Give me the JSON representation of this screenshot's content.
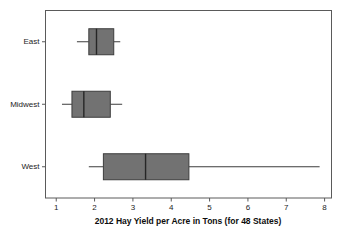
{
  "chart_data": {
    "type": "box",
    "title": "",
    "xlabel": "2012 Hay Yield per Acre in Tons (for 48 States)",
    "ylabel": "",
    "orientation": "horizontal",
    "grid": false,
    "legend": "none",
    "xlim": [
      0.72,
      8.18
    ],
    "xticks": [
      1,
      2,
      3,
      4,
      5,
      6,
      7,
      8
    ],
    "xticklabels": [
      "1",
      "2",
      "3",
      "4",
      "5",
      "6",
      "7",
      "8"
    ],
    "categories": [
      "East",
      "Midwest",
      "West"
    ],
    "boxes": [
      {
        "label": "East",
        "whisker_low": 1.54,
        "q1": 1.85,
        "median": 2.05,
        "q3": 2.5,
        "whisker_high": 2.67,
        "outliers": []
      },
      {
        "label": "Midwest",
        "whisker_low": 1.15,
        "q1": 1.41,
        "median": 1.72,
        "q3": 2.41,
        "whisker_high": 2.72,
        "outliers": []
      },
      {
        "label": "West",
        "whisker_low": 1.85,
        "q1": 2.23,
        "median": 3.33,
        "q3": 4.46,
        "whisker_high": 7.87,
        "outliers": []
      }
    ],
    "colors": {
      "box_fill": "#727272",
      "box_edge": "#3d3d3d",
      "median": "#262626",
      "whisker": "#3d3d3d",
      "frame": "#5a5a5a",
      "text": "#1c1c1c",
      "background": "#ffffff"
    }
  }
}
